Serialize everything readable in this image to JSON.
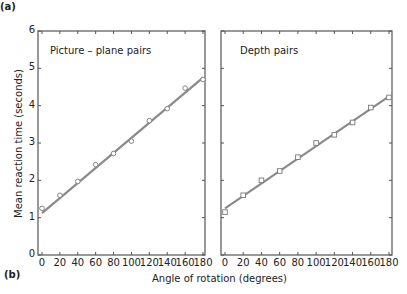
{
  "panel_labels": {
    "a": "(a)",
    "b": "(b)"
  },
  "chart_data": [
    {
      "type": "scatter",
      "title": "Picture – plane pairs",
      "xlabel": "Angle of rotation (degrees)",
      "ylabel": "Mean reaction time (seconds)",
      "xlim": [
        0,
        180
      ],
      "ylim": [
        0,
        6
      ],
      "x_ticks": [
        0,
        20,
        40,
        60,
        80,
        100,
        120,
        140,
        160,
        180
      ],
      "y_ticks": [
        0,
        1,
        2,
        3,
        4,
        5,
        6
      ],
      "marker": "circle",
      "x": [
        0,
        20,
        40,
        60,
        80,
        100,
        120,
        140,
        160,
        180
      ],
      "values": [
        1.25,
        1.6,
        1.97,
        2.42,
        2.72,
        3.05,
        3.6,
        3.92,
        4.47,
        4.7
      ],
      "fit_line": {
        "x": [
          0,
          180
        ],
        "y": [
          1.12,
          4.75
        ]
      },
      "grid": false
    },
    {
      "type": "scatter",
      "title": "Depth pairs",
      "xlabel": "Angle of rotation (degrees)",
      "ylabel": "Mean reaction time (seconds)",
      "xlim": [
        0,
        180
      ],
      "ylim": [
        0,
        6
      ],
      "x_ticks": [
        0,
        20,
        40,
        60,
        80,
        100,
        120,
        140,
        160,
        180
      ],
      "y_ticks": [
        0,
        1,
        2,
        3,
        4,
        5,
        6
      ],
      "marker": "square",
      "x": [
        0,
        20,
        40,
        60,
        80,
        100,
        120,
        140,
        160,
        180
      ],
      "values": [
        1.15,
        1.6,
        2.0,
        2.25,
        2.62,
        3.0,
        3.22,
        3.55,
        3.95,
        4.22
      ],
      "fit_line": {
        "x": [
          0,
          180
        ],
        "y": [
          1.25,
          4.25
        ]
      },
      "grid": false
    }
  ],
  "shared": {
    "xlabel": "Angle of rotation (degrees)",
    "ylabel": "Mean reaction time (seconds)"
  },
  "colors": {
    "axis": "#555555",
    "line": "#8a8a8a",
    "marker": "#777777"
  }
}
